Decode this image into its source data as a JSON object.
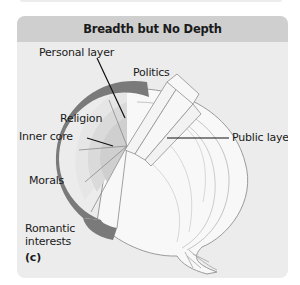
{
  "panel": {
    "title": "Breadth but No Depth",
    "panel_id": "(c)"
  },
  "labels": {
    "personal_layer": "Personal layer",
    "politics": "Politics",
    "religion": "Religion",
    "inner_core": "Inner core",
    "public_layer": "Public layer",
    "morals": "Morals",
    "romantic_interests": "Romantic interests"
  },
  "colors": {
    "panel_bg": "#ececec",
    "header_bg": "#cfcfcf",
    "ring": "#7a7a7a",
    "onion_outline": "#9a9a9a",
    "onion_fill": "#f8f8f8",
    "leader_line": "#111111"
  }
}
